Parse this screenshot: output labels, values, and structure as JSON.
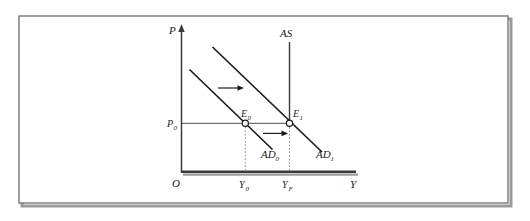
{
  "figure": {
    "type": "economics-ad-as-diagram",
    "frame": {
      "border_color": "#808080",
      "shadow_color": "#9a9a9a",
      "background": "#ffffff"
    },
    "axes": {
      "vertical_label": "P",
      "horizontal_label": "Y",
      "origin_label": "O",
      "axis_color": "#333333"
    },
    "curves": [
      {
        "name": "AD0",
        "label": "AD",
        "subscript": "0",
        "kind": "aggregate-demand",
        "color": "#1a1a1a"
      },
      {
        "name": "AD1",
        "label": "AD",
        "subscript": "1",
        "kind": "aggregate-demand",
        "color": "#1a1a1a"
      },
      {
        "name": "AS",
        "label": "AS",
        "subscript": "",
        "kind": "aggregate-supply-vertical",
        "color": "#333333"
      }
    ],
    "points": [
      {
        "name": "E0",
        "label": "E",
        "subscript": "0",
        "description": "initial equilibrium"
      },
      {
        "name": "E1",
        "label": "E",
        "subscript": "1",
        "description": "new equilibrium at full employment"
      }
    ],
    "ticks": {
      "y_axis": [
        {
          "name": "P0",
          "label": "P",
          "subscript": "0"
        }
      ],
      "x_axis": [
        {
          "name": "Y0",
          "label": "Y",
          "subscript": "0"
        },
        {
          "name": "YF",
          "label": "Y",
          "subscript": "F"
        }
      ]
    },
    "arrows": [
      {
        "name": "shift-arrow-upper",
        "direction": "right",
        "meaning": "AD curve shifts rightward"
      },
      {
        "name": "shift-arrow-lower",
        "direction": "right",
        "meaning": "output expands from Y0 to YF"
      }
    ]
  }
}
